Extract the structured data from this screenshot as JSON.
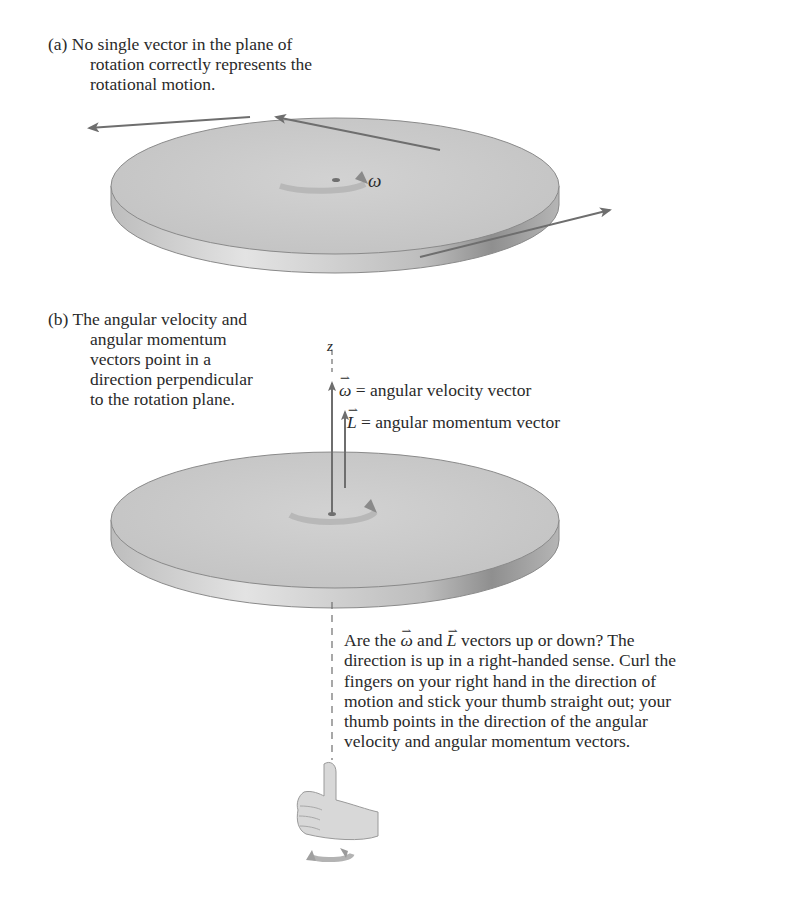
{
  "figure": {
    "panel_a": {
      "label": "(a)",
      "caption_lines": [
        "No single vector in the plane of",
        "rotation correctly represents the",
        "rotational motion."
      ],
      "rotation_symbol": "ω"
    },
    "panel_b": {
      "label": "(b)",
      "caption_lines": [
        "The angular velocity and",
        "angular momentum",
        "vectors point in a",
        "direction perpendicular",
        "to the rotation plane."
      ],
      "axis_label": "z",
      "omega_symbol": "ω",
      "omega_definition": " = angular velocity vector",
      "L_symbol": "L",
      "L_definition": " = angular momentum vector",
      "explanation": {
        "line1_pre": "Are the ",
        "omega_symbol": "ω",
        "line1_mid": " and ",
        "L_symbol": "L",
        "line1_post": " vectors up or down? The",
        "lines": [
          "direction is up in a right-handed sense. Curl the",
          "fingers on your right hand in the direction of",
          "motion and stick your thumb straight out; your",
          "thumb points in the direction of the angular",
          "velocity and angular momentum vectors."
        ]
      }
    },
    "colors": {
      "disk_top": "#c9c9c9",
      "disk_edge": "#b0b0b0",
      "arrow": "#6e6e6e",
      "text": "#2a2a2a"
    }
  }
}
